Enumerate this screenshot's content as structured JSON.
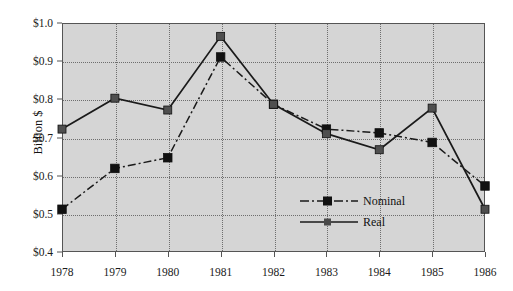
{
  "chart_data": {
    "type": "line",
    "title": "",
    "xlabel": "",
    "ylabel": "Billion $",
    "categories": [
      "1978",
      "1979",
      "1980",
      "1981",
      "1982",
      "1983",
      "1984",
      "1985",
      "1986"
    ],
    "x": [
      1978,
      1979,
      1980,
      1981,
      1982,
      1983,
      1984,
      1985,
      1986
    ],
    "ylim": [
      0.4,
      1.0
    ],
    "xlim": [
      1978,
      1986
    ],
    "ytick_labels": [
      "$0.4",
      "$0.5",
      "$0.6",
      "$0.7",
      "$0.8",
      "$0.9",
      "$1.0"
    ],
    "ytick_values": [
      0.4,
      0.5,
      0.6,
      0.7,
      0.8,
      0.9,
      1.0
    ],
    "xtick_labels": [
      "1978",
      "1979",
      "1980",
      "1981",
      "1982",
      "1983",
      "1984",
      "1985",
      "1986"
    ],
    "grid": true,
    "legend_position": "center-bottom-inside",
    "series": [
      {
        "name": "Nominal",
        "style": "dash-dot",
        "marker": "square",
        "color": "#1a1a1a",
        "values": [
          0.512,
          0.619,
          0.647,
          0.911,
          0.787,
          0.722,
          0.712,
          0.687,
          0.573
        ]
      },
      {
        "name": "Real",
        "style": "solid",
        "marker": "square",
        "color": "#1a1a1a",
        "values": [
          0.722,
          0.803,
          0.772,
          0.965,
          0.787,
          0.71,
          0.668,
          0.777,
          0.512
        ]
      }
    ]
  },
  "legend": {
    "entries": [
      {
        "label": "Nominal"
      },
      {
        "label": "Real"
      }
    ]
  },
  "axes": {
    "y_title": "Billion $"
  },
  "colors": {
    "plot_background": "#d5d5d5",
    "page_background": "#ffffff",
    "axis": "#555555",
    "grid": "#6e6e6e",
    "series": "#1a1a1a"
  }
}
